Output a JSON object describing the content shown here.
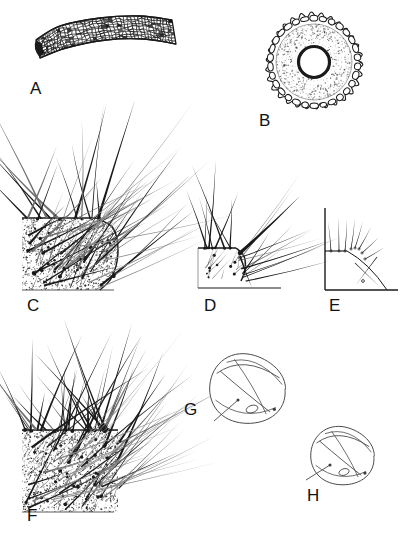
{
  "figure": {
    "kind": "scientific-illustration-plate",
    "width": 406,
    "height": 549,
    "background_color": "#ffffff",
    "ink_color": "#1a1a1a",
    "panel_count": 8
  },
  "labels": [
    {
      "id": "A",
      "text": "A",
      "x": 30,
      "y": 80
    },
    {
      "id": "B",
      "text": "B",
      "x": 259,
      "y": 112
    },
    {
      "id": "C",
      "text": "C",
      "x": 27,
      "y": 297
    },
    {
      "id": "D",
      "text": "D",
      "x": 204,
      "y": 297
    },
    {
      "id": "E",
      "text": "E",
      "x": 329,
      "y": 297
    },
    {
      "id": "F",
      "text": "F",
      "x": 27,
      "y": 507
    },
    {
      "id": "G",
      "text": "G",
      "x": 184,
      "y": 401
    },
    {
      "id": "H",
      "text": "H",
      "x": 307,
      "y": 487
    }
  ],
  "panels": {
    "A": {
      "name": "curved-tube-reticulate",
      "description": "Curved elongate tubular structure with dense polygonal cell reticulation; dark blunt left end.",
      "bbox": [
        30,
        14,
        150,
        62
      ],
      "curve": {
        "top": [
          [
            36,
            40
          ],
          [
            60,
            26
          ],
          [
            100,
            18
          ],
          [
            140,
            16
          ],
          [
            172,
            20
          ]
        ],
        "bottom": [
          [
            40,
            58
          ],
          [
            66,
            48
          ],
          [
            106,
            40
          ],
          [
            144,
            39
          ],
          [
            176,
            44
          ]
        ],
        "left_cap_dark": true
      },
      "cell_texture": {
        "type": "polygonal-mesh",
        "cell_size": 4.2,
        "rows": 9,
        "jitter": 0.45
      }
    },
    "B": {
      "name": "cross-section-ring",
      "description": "Circular transverse section: scalloped outer ring of rounded cells, stippled cortex, thick dark inner ring, white central lumen.",
      "center": [
        314,
        62
      ],
      "outer_radius": 46,
      "outer_lobes": 30,
      "lobe_amplitude": 2.6,
      "cortex_outer_radius": 38,
      "cortex_inner_radius": 16,
      "lumen_ring_radius": 15.5,
      "lumen_ring_width": 3.2,
      "lumen_radius": 13,
      "stipple_count": 520
    },
    "C": {
      "name": "setose-corner-stippled-dense",
      "description": "Stippled integument corner, rounded right margin; many long tapering setae with dark basal sockets radiating up and to the right.",
      "body": {
        "left": 22,
        "top": 218,
        "right": 118,
        "bottom": 290,
        "corner_curve": [
          [
            96,
            218
          ],
          [
            113,
            228
          ],
          [
            118,
            252
          ],
          [
            112,
            277
          ],
          [
            100,
            290
          ]
        ]
      },
      "stipple_count": 1500,
      "setae_count": 46,
      "socket_count": 22
    },
    "D": {
      "name": "setose-corner-outline",
      "description": "Outline version of the setose corner: plain margin, no stipple, fewer setae, one very thick dark seta.",
      "body": {
        "left": 198,
        "top": 248,
        "right": 243,
        "bottom": 288,
        "corner_curve": [
          [
            236,
            248
          ],
          [
            244,
            256
          ],
          [
            245,
            270
          ],
          [
            241,
            281
          ]
        ]
      },
      "setae_count": 26,
      "thick_seta": {
        "from": [
          240,
          253
        ],
        "to": [
          300,
          196
        ],
        "width": 3.4
      }
    },
    "E": {
      "name": "setose-corner-sparse",
      "description": "Sparse schematic: vertical left margin, horizontal ledge, few fine setae and a crossed pair.",
      "body": {
        "left_x": 325,
        "top_y": 208,
        "bottom_y": 290,
        "ledge_y": 251,
        "right_x": 398
      },
      "setae_count": 12
    },
    "F": {
      "name": "setose-patch-dense",
      "description": "Densely setose stippled patch; numerous long setae with prominent dark sockets, fanning upward and to the right.",
      "body": {
        "left": 22,
        "top": 430,
        "right": 118,
        "bottom": 512
      },
      "stipple_count": 1700,
      "setae_count": 58,
      "socket_count": 34
    },
    "G": {
      "name": "rounded-body-outline-large",
      "description": "Faint rounded body (near-circular) with internal curved folds, a small oval structure near lower middle and a fine projecting stalk at lower left.",
      "center": [
        247,
        389
      ],
      "radius": 37,
      "stalk": {
        "from": [
          238,
          400
        ],
        "to": [
          214,
          421
        ]
      },
      "small_oval": {
        "cx": 252,
        "cy": 409,
        "rx": 6,
        "ry": 3.6
      }
    },
    "H": {
      "name": "rounded-body-outline-small",
      "description": "Second rounded body, slightly smaller, same internal folds, oval structure and projecting stalk at lower left.",
      "center": [
        342,
        456
      ],
      "radius": 31,
      "stalk": {
        "from": [
          330,
          465
        ],
        "to": [
          306,
          480
        ]
      },
      "small_oval": {
        "cx": 344,
        "cy": 472,
        "rx": 5.2,
        "ry": 3.2
      }
    }
  }
}
